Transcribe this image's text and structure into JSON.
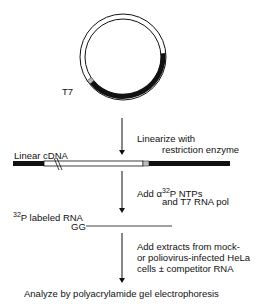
{
  "plasmid": {
    "promoter_label": "T7"
  },
  "step1": {
    "line1": "Linearize with",
    "line2": "restriction enzyme"
  },
  "linear_cdna": {
    "label": "Linear cDNA"
  },
  "step2": {
    "line1_prefix": "Add ",
    "alpha": "α",
    "sup": "32",
    "line1_suffix": "P  NTPs",
    "line2": "and  T7  RNA  pol"
  },
  "labeled_rna": {
    "sup": "32",
    "label": "P  labeled  RNA",
    "end_label": "GG"
  },
  "step3": {
    "line1": "Add  extracts  from  mock-",
    "line2": "or  poliovirus-infected  HeLa",
    "line3": "cells ±  competitor  RNA"
  },
  "final": {
    "label": "Analyze  by  polyacrylamide  gel  electrophoresis"
  },
  "colors": {
    "ink": "#111111",
    "promoter": "#bbbbbb",
    "background": "#ffffff"
  }
}
